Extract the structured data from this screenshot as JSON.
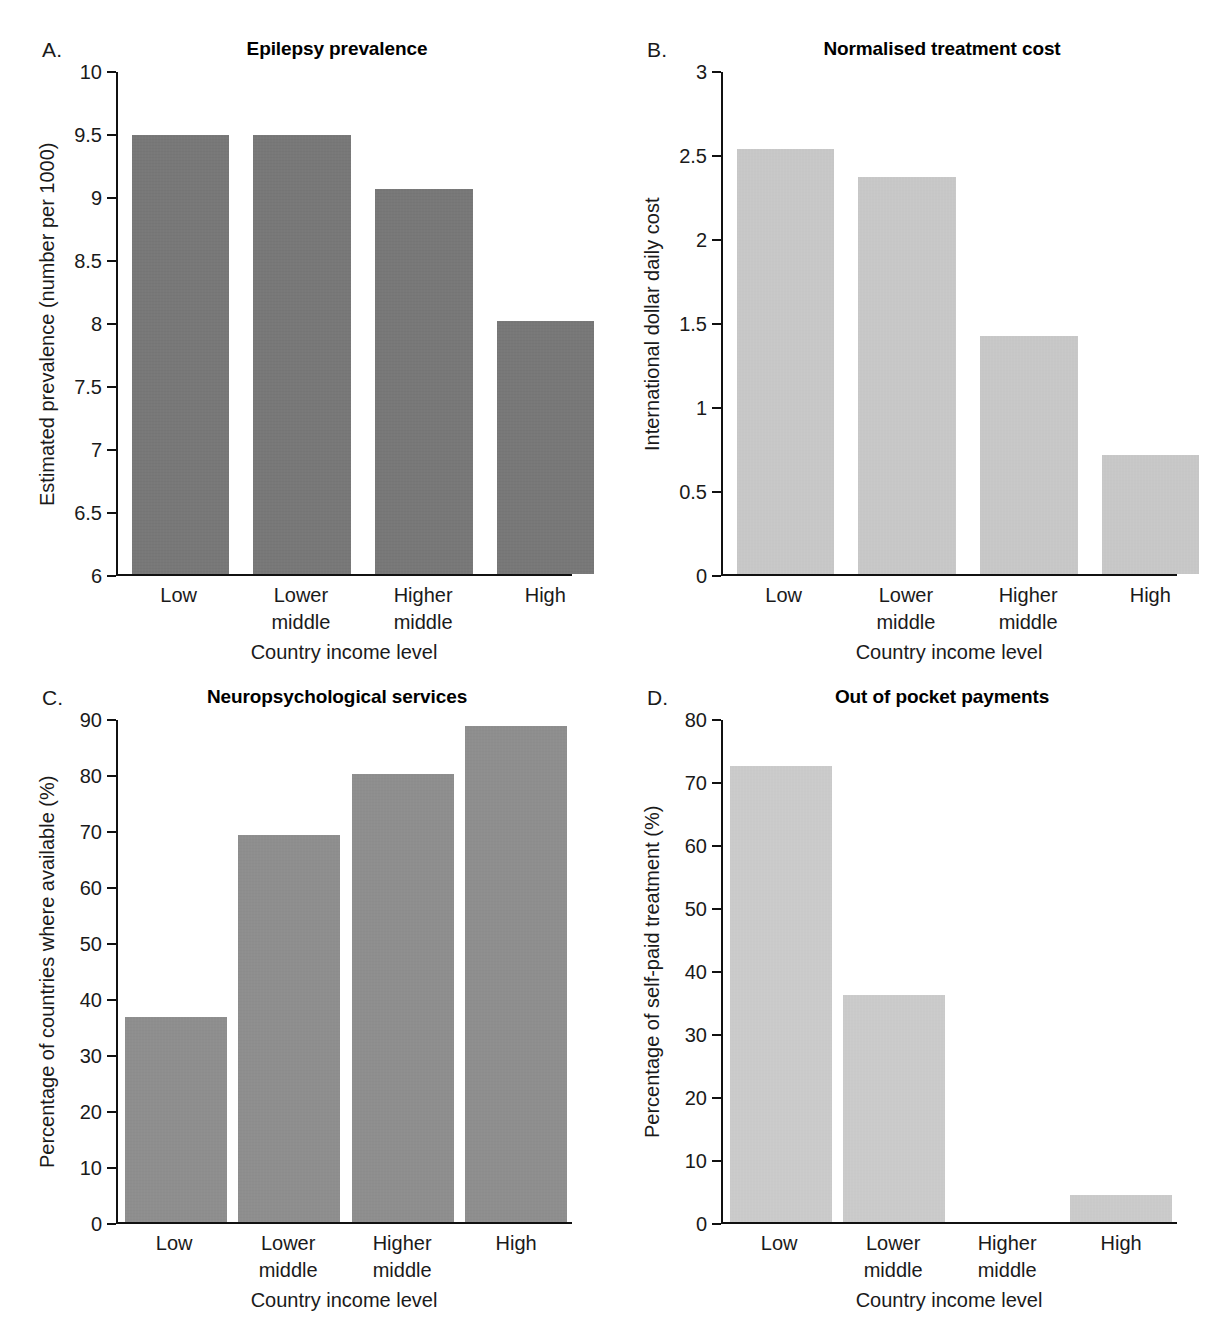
{
  "figure": {
    "background": "#ffffff",
    "categories": [
      "Low",
      "Lower middle",
      "Higher middle",
      "High"
    ],
    "xaxis_title": "Country income level"
  },
  "panels": [
    {
      "letter": "A.",
      "title": "Epilepsy prevalence",
      "ylabel": "Estimated prevalence (number per 1000)",
      "xlabel": "Country income level",
      "bar_color": "#6f6f6f",
      "yticks": [
        "6",
        "6.5",
        "7",
        "7.5",
        "8",
        "8.5",
        "9",
        "9.5",
        "10"
      ],
      "values": [
        9.5,
        9.5,
        9.07,
        8.02
      ]
    },
    {
      "letter": "B.",
      "title": "Normalised treatment cost",
      "ylabel": "International dollar daily cost",
      "xlabel": "Country income level",
      "bar_color": "#d2d2d2",
      "yticks": [
        "0",
        "0.5",
        "1",
        "1.5",
        "2",
        "2.5",
        "3"
      ],
      "values": [
        2.54,
        2.37,
        1.42,
        0.71
      ]
    },
    {
      "letter": "C.",
      "title": "Neuropsychological services",
      "ylabel": "Percentage of countries where available (%)",
      "xlabel": "Country income level",
      "bar_color": "#8b8b8b",
      "yticks": [
        "0",
        "10",
        "20",
        "30",
        "40",
        "50",
        "60",
        "70",
        "80",
        "90"
      ],
      "values": [
        36.8,
        69.4,
        80.3,
        89.0
      ]
    },
    {
      "letter": "D.",
      "title": "Out of pocket payments",
      "ylabel": "Percentage of self-paid treatment (%)",
      "xlabel": "Country income level",
      "bar_color": "#d6d6d6",
      "yticks": [
        "0",
        "10",
        "20",
        "30",
        "40",
        "50",
        "60",
        "70",
        "80"
      ],
      "values": [
        72.7,
        36.1,
        0.0,
        4.3
      ]
    }
  ],
  "chart_data": [
    {
      "type": "bar",
      "panel": "A",
      "title": "Epilepsy prevalence",
      "xlabel": "Country income level",
      "ylabel": "Estimated prevalence (number per 1000)",
      "categories": [
        "Low",
        "Lower middle",
        "Higher middle",
        "High"
      ],
      "values": [
        9.5,
        9.5,
        9.07,
        8.02
      ],
      "ylim": [
        6,
        10
      ],
      "ytick_step": 0.5,
      "grid": false,
      "legend": null,
      "bar_color": "#6f6f6f"
    },
    {
      "type": "bar",
      "panel": "B",
      "title": "Normalised treatment cost",
      "xlabel": "Country income level",
      "ylabel": "International dollar daily cost",
      "categories": [
        "Low",
        "Lower middle",
        "Higher middle",
        "High"
      ],
      "values": [
        2.54,
        2.37,
        1.42,
        0.71
      ],
      "ylim": [
        0,
        3
      ],
      "ytick_step": 0.5,
      "grid": false,
      "legend": null,
      "bar_color": "#d2d2d2"
    },
    {
      "type": "bar",
      "panel": "C",
      "title": "Neuropsychological services",
      "xlabel": "Country income level",
      "ylabel": "Percentage of countries where available (%)",
      "categories": [
        "Low",
        "Lower middle",
        "Higher middle",
        "High"
      ],
      "values": [
        36.8,
        69.4,
        80.3,
        89.0
      ],
      "ylim": [
        0,
        90
      ],
      "ytick_step": 10,
      "grid": false,
      "legend": null,
      "bar_color": "#8b8b8b"
    },
    {
      "type": "bar",
      "panel": "D",
      "title": "Out of pocket payments",
      "xlabel": "Country income level",
      "ylabel": "Percentage of self-paid treatment (%)",
      "categories": [
        "Low",
        "Lower middle",
        "Higher middle",
        "High"
      ],
      "values": [
        72.7,
        36.1,
        0.0,
        4.3
      ],
      "ylim": [
        0,
        80
      ],
      "ytick_step": 10,
      "grid": false,
      "legend": null,
      "bar_color": "#d6d6d6"
    }
  ]
}
